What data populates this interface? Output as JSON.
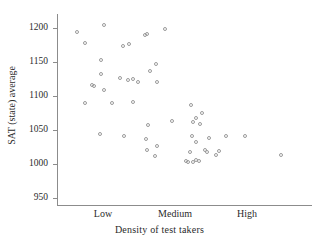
{
  "chart_data": {
    "type": "scatter",
    "title": "",
    "xlabel": "Density of test takers",
    "ylabel": "SAT (state) average",
    "grid": false,
    "legend": "none",
    "xtick_labels": [
      "Low",
      "Medium",
      "High"
    ],
    "xtick_positions": [
      103,
      175,
      247
    ],
    "ytick_labels": [
      "950",
      "1000",
      "1050",
      "1100",
      "1150",
      "1200"
    ],
    "ytick_values": [
      950,
      1000,
      1050,
      1100,
      1150,
      1200
    ],
    "ylim": [
      935,
      1215
    ],
    "xlim": [
      0,
      100
    ],
    "n_points": 58,
    "marker": "open-circle",
    "marker_color": "#9a9a9a",
    "points": [
      {
        "px": 77,
        "py": 32,
        "x": 8.1,
        "y": 1194
      },
      {
        "px": 104,
        "py": 25,
        "x": 18.7,
        "y": 1204
      },
      {
        "px": 85,
        "py": 43,
        "x": 11.0,
        "y": 1178
      },
      {
        "px": 123,
        "py": 46,
        "x": 25.7,
        "y": 1173
      },
      {
        "px": 129,
        "py": 44,
        "x": 28.0,
        "y": 1176
      },
      {
        "px": 145,
        "py": 35,
        "x": 34.3,
        "y": 1189
      },
      {
        "px": 147,
        "py": 34,
        "x": 35.0,
        "y": 1190
      },
      {
        "px": 165,
        "py": 29,
        "x": 42.2,
        "y": 1199
      },
      {
        "px": 101,
        "py": 60,
        "x": 17.5,
        "y": 1153
      },
      {
        "px": 101,
        "py": 74,
        "x": 17.5,
        "y": 1132
      },
      {
        "px": 120,
        "py": 78,
        "x": 24.9,
        "y": 1127
      },
      {
        "px": 128,
        "py": 80,
        "x": 28.0,
        "y": 1124
      },
      {
        "px": 133,
        "py": 79,
        "x": 30.0,
        "y": 1126
      },
      {
        "px": 138,
        "py": 82,
        "x": 31.9,
        "y": 1122
      },
      {
        "px": 150,
        "py": 71,
        "x": 36.6,
        "y": 1136
      },
      {
        "px": 156,
        "py": 64,
        "x": 39.0,
        "y": 1147
      },
      {
        "px": 157,
        "py": 82,
        "x": 39.4,
        "y": 1121
      },
      {
        "px": 92,
        "py": 85,
        "x": 14.0,
        "y": 1118
      },
      {
        "px": 94,
        "py": 86,
        "x": 14.8,
        "y": 1116
      },
      {
        "px": 104,
        "py": 90,
        "x": 18.7,
        "y": 1111
      },
      {
        "px": 85,
        "py": 103,
        "x": 11.0,
        "y": 1087
      },
      {
        "px": 112,
        "py": 103,
        "x": 21.8,
        "y": 1087
      },
      {
        "px": 133,
        "py": 102,
        "x": 30.0,
        "y": 1088
      },
      {
        "px": 191,
        "py": 105,
        "x": 52.4,
        "y": 1084
      },
      {
        "px": 196,
        "py": 118,
        "x": 54.3,
        "y": 1055
      },
      {
        "px": 202,
        "py": 113,
        "x": 56.7,
        "y": 1065
      },
      {
        "px": 172,
        "py": 121,
        "x": 45.0,
        "y": 1053
      },
      {
        "px": 193,
        "py": 122,
        "x": 53.2,
        "y": 1051
      },
      {
        "px": 200,
        "py": 124,
        "x": 55.9,
        "y": 1048
      },
      {
        "px": 148,
        "py": 125,
        "x": 35.4,
        "y": 1046
      },
      {
        "px": 100,
        "py": 134,
        "x": 17.1,
        "y": 1042
      },
      {
        "px": 124,
        "py": 136,
        "x": 26.5,
        "y": 1034
      },
      {
        "px": 192,
        "py": 136,
        "x": 52.8,
        "y": 1034
      },
      {
        "px": 245,
        "py": 136,
        "x": 73.4,
        "y": 1028
      },
      {
        "px": 209,
        "py": 138,
        "x": 59.1,
        "y": 1026
      },
      {
        "px": 226,
        "py": 136,
        "x": 65.7,
        "y": 1030
      },
      {
        "px": 146,
        "py": 139,
        "x": 34.6,
        "y": 1038
      },
      {
        "px": 196,
        "py": 142,
        "x": 54.3,
        "y": 1020
      },
      {
        "px": 157,
        "py": 146,
        "x": 39.4,
        "y": 1022
      },
      {
        "px": 147,
        "py": 150,
        "x": 35.0,
        "y": 1014
      },
      {
        "px": 190,
        "py": 152,
        "x": 52.0,
        "y": 1008
      },
      {
        "px": 205,
        "py": 150,
        "x": 57.5,
        "y": 1011
      },
      {
        "px": 207,
        "py": 152,
        "x": 58.3,
        "y": 1009
      },
      {
        "px": 219,
        "py": 151,
        "x": 62.9,
        "y": 1012
      },
      {
        "px": 216,
        "py": 155,
        "x": 61.8,
        "y": 1004
      },
      {
        "px": 281,
        "py": 155,
        "x": 87.2,
        "y": 1005
      },
      {
        "px": 155,
        "py": 156,
        "x": 38.6,
        "y": 1005
      },
      {
        "px": 186,
        "py": 161,
        "x": 51.2,
        "y": 993
      },
      {
        "px": 188,
        "py": 162,
        "x": 51.9,
        "y": 992
      },
      {
        "px": 193,
        "py": 162,
        "x": 53.2,
        "y": 992
      },
      {
        "px": 196,
        "py": 160,
        "x": 54.3,
        "y": 996
      },
      {
        "px": 199,
        "py": 161,
        "x": 55.5,
        "y": 994
      }
    ]
  },
  "axis": {
    "y_title": "SAT (state) average",
    "x_title": "Density of test takers"
  }
}
